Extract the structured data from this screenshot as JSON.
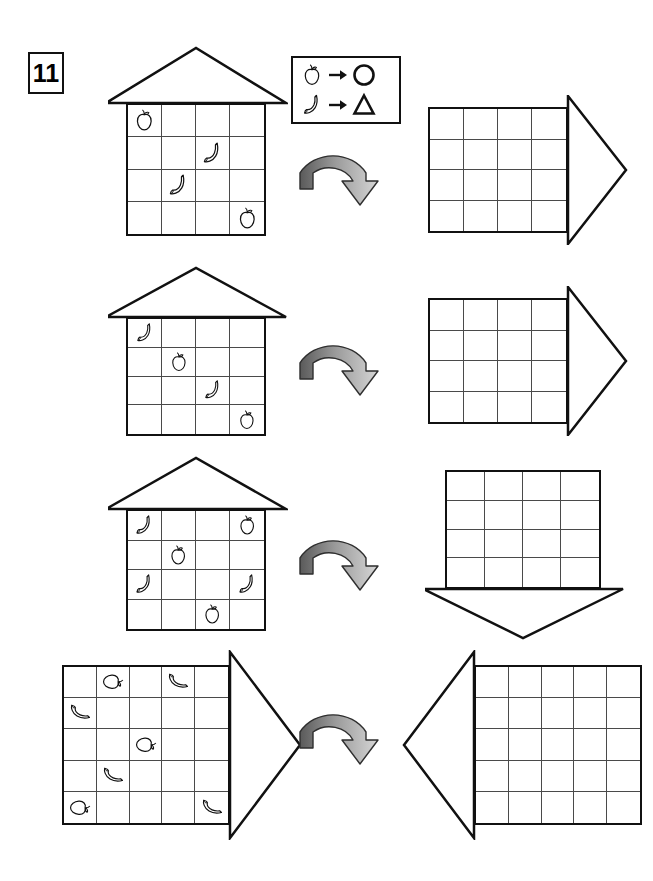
{
  "exercise": {
    "number": "11"
  },
  "legend": {
    "name": "transformation-legend",
    "rows": [
      {
        "from": "apple",
        "from_label": "apple-icon",
        "to": "circle",
        "to_label": "circle-shape"
      },
      {
        "from": "banana",
        "from_label": "banana-icon",
        "to": "triangle",
        "to_label": "triangle-shape"
      }
    ]
  },
  "colors": {
    "ink": "#111111",
    "grid_line": "#4a4a4a",
    "arrow_dark": "#5a5a5a",
    "arrow_light": "#d6d6d6",
    "paper": "#ffffff"
  },
  "figures": [
    {
      "id": "house-1-source",
      "name": "house-grid-source-1",
      "rows": 4,
      "cols": 4,
      "roof": "up",
      "filled": true,
      "items": [
        {
          "r": 0,
          "c": 0,
          "fruit": "apple"
        },
        {
          "r": 1,
          "c": 2,
          "fruit": "banana"
        },
        {
          "r": 2,
          "c": 1,
          "fruit": "banana"
        },
        {
          "r": 3,
          "c": 3,
          "fruit": "apple"
        }
      ]
    },
    {
      "id": "house-1-target",
      "name": "house-grid-answer-1",
      "rows": 4,
      "cols": 4,
      "roof": "right",
      "filled": false,
      "items": []
    },
    {
      "id": "house-2-source",
      "name": "house-grid-source-2",
      "rows": 4,
      "cols": 4,
      "roof": "up",
      "filled": true,
      "items": [
        {
          "r": 0,
          "c": 0,
          "fruit": "banana"
        },
        {
          "r": 1,
          "c": 1,
          "fruit": "apple"
        },
        {
          "r": 2,
          "c": 2,
          "fruit": "banana"
        },
        {
          "r": 3,
          "c": 3,
          "fruit": "apple"
        }
      ]
    },
    {
      "id": "house-2-target",
      "name": "house-grid-answer-2",
      "rows": 4,
      "cols": 4,
      "roof": "right",
      "filled": false,
      "items": []
    },
    {
      "id": "house-3-source",
      "name": "house-grid-source-3",
      "rows": 4,
      "cols": 4,
      "roof": "up",
      "filled": true,
      "items": [
        {
          "r": 0,
          "c": 0,
          "fruit": "banana"
        },
        {
          "r": 0,
          "c": 3,
          "fruit": "apple"
        },
        {
          "r": 1,
          "c": 1,
          "fruit": "apple"
        },
        {
          "r": 2,
          "c": 0,
          "fruit": "banana"
        },
        {
          "r": 2,
          "c": 3,
          "fruit": "banana"
        },
        {
          "r": 3,
          "c": 2,
          "fruit": "apple"
        }
      ]
    },
    {
      "id": "house-3-target",
      "name": "house-grid-answer-3",
      "rows": 4,
      "cols": 4,
      "roof": "down",
      "filled": false,
      "items": []
    },
    {
      "id": "house-4-source",
      "name": "house-grid-source-4",
      "rows": 5,
      "cols": 5,
      "roof": "right",
      "filled": true,
      "rotated_items": true,
      "items": [
        {
          "r": 0,
          "c": 1,
          "fruit": "apple"
        },
        {
          "r": 0,
          "c": 3,
          "fruit": "banana"
        },
        {
          "r": 1,
          "c": 0,
          "fruit": "banana"
        },
        {
          "r": 2,
          "c": 2,
          "fruit": "apple"
        },
        {
          "r": 3,
          "c": 1,
          "fruit": "banana"
        },
        {
          "r": 4,
          "c": 0,
          "fruit": "apple"
        },
        {
          "r": 4,
          "c": 4,
          "fruit": "banana"
        }
      ]
    },
    {
      "id": "house-4-target",
      "name": "house-grid-answer-4",
      "rows": 5,
      "cols": 5,
      "roof": "left",
      "filled": false,
      "items": []
    }
  ],
  "arrows": [
    {
      "id": "rotate-arrow-1",
      "name": "rotation-arrow-row-1",
      "direction": "clockwise"
    },
    {
      "id": "rotate-arrow-2",
      "name": "rotation-arrow-row-2",
      "direction": "clockwise"
    },
    {
      "id": "rotate-arrow-3",
      "name": "rotation-arrow-row-3",
      "direction": "clockwise"
    },
    {
      "id": "rotate-arrow-4",
      "name": "rotation-arrow-row-4",
      "direction": "clockwise"
    }
  ]
}
